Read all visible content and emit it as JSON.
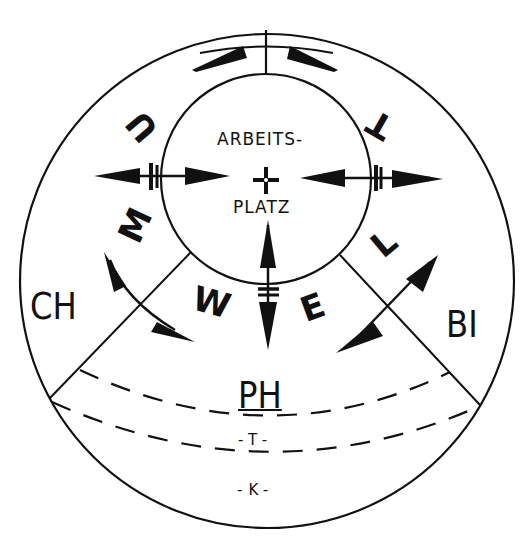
{
  "diagram": {
    "type": "concentric workplace environment diagram",
    "colors": {
      "ink": "#111111",
      "background": "#ffffff"
    },
    "center": {
      "label_line1": "ARBEITS-",
      "label_line2": "PLATZ",
      "symbol": "crosshair"
    },
    "ring_letters": {
      "left_side": [
        "U",
        "M",
        "W"
      ],
      "right_side": [
        "E",
        "L",
        "T"
      ],
      "reading": "UMWELT (environment), written around the ring"
    },
    "sectors": {
      "left": "CH",
      "right": "BI",
      "bottom": "PH"
    },
    "bottom_bands": [
      {
        "label": "-T-"
      },
      {
        "label": "-K-"
      }
    ],
    "arrows": [
      {
        "name": "top-arc-double-arrow",
        "direction": "bidirectional-circumferential"
      },
      {
        "name": "left-horizontal-double-arrow",
        "direction": "bidirectional-radial"
      },
      {
        "name": "right-horizontal-double-arrow",
        "direction": "bidirectional-radial"
      },
      {
        "name": "bottom-vertical-double-arrow",
        "direction": "bidirectional-radial"
      },
      {
        "name": "lower-left-double-arrow",
        "direction": "bidirectional-across-boundary"
      },
      {
        "name": "lower-right-double-arrow",
        "direction": "bidirectional-across-boundary"
      }
    ]
  }
}
